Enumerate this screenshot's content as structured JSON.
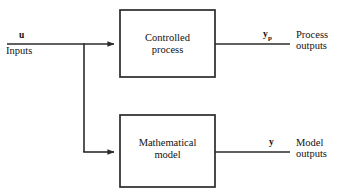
{
  "diagram": {
    "type": "block-diagram",
    "background_color": "#ffffff",
    "line_color": "#2b2b2b",
    "text_color": "#111111",
    "input": {
      "variable": "u",
      "caption": "Inputs"
    },
    "blocks": [
      {
        "id": "controlled-process",
        "line1": "Controlled",
        "line2": "process",
        "x": 120,
        "y": 10,
        "width": 95,
        "height": 67
      },
      {
        "id": "mathematical-model",
        "line1": "Mathematical",
        "line2": "model",
        "x": 120,
        "y": 115,
        "width": 95,
        "height": 72
      }
    ],
    "outputs": [
      {
        "id": "process-output",
        "variable": "y",
        "subscript": "p",
        "caption_line1": "Process",
        "caption_line2": "outputs"
      },
      {
        "id": "model-output",
        "variable": "y",
        "subscript": "",
        "caption_line1": "Model",
        "caption_line2": "outputs"
      }
    ],
    "connections": {
      "input_line_y": 44,
      "branch_x": 84,
      "lower_line_y": 152,
      "input_line_start_x": 7,
      "output_line_end_x": 290
    }
  }
}
